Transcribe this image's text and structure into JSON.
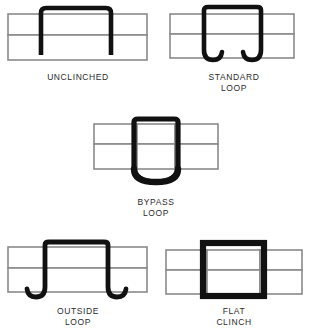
{
  "diagram": {
    "colors": {
      "staple": "#111111",
      "sheet_outline": "#8a8a8a",
      "sheet_fill": "#ffffff",
      "caption_text": "#2b2b2b",
      "background": "#ffffff"
    },
    "figures": [
      {
        "id": "unclinched",
        "caption": "UNCLINCHED",
        "caption_lines": [
          "UNCLINCHED"
        ],
        "staple_form": "square-staple-straight-legs",
        "legs": "straight, not bent",
        "sheets": 2
      },
      {
        "id": "standard-loop",
        "caption": "STANDARD\nLOOP",
        "caption_lines": [
          "STANDARD",
          "LOOP"
        ],
        "staple_form": "legs-curled-inward-j-hooks",
        "legs": "curled inward toward center",
        "sheets": 2
      },
      {
        "id": "bypass-loop",
        "caption": "BYPASS\nLOOP",
        "caption_lines": [
          "BYPASS",
          "LOOP"
        ],
        "staple_form": "legs-cross-forming-u-curve",
        "legs": "legs bypass and overlap forming a U",
        "sheets": 2
      },
      {
        "id": "outside-loop",
        "caption": "OUTSIDE\nLOOP",
        "caption_lines": [
          "OUTSIDE",
          "LOOP"
        ],
        "staple_form": "legs-curled-outward-j-hooks",
        "legs": "curled outward away from center",
        "sheets": 2
      },
      {
        "id": "flat-clinch",
        "caption": "FLAT\nCLINCH",
        "caption_lines": [
          "FLAT",
          "CLINCH"
        ],
        "staple_form": "closed-rectangle-flat-bottom",
        "legs": "bent flat against the material",
        "sheets": 2
      }
    ]
  }
}
